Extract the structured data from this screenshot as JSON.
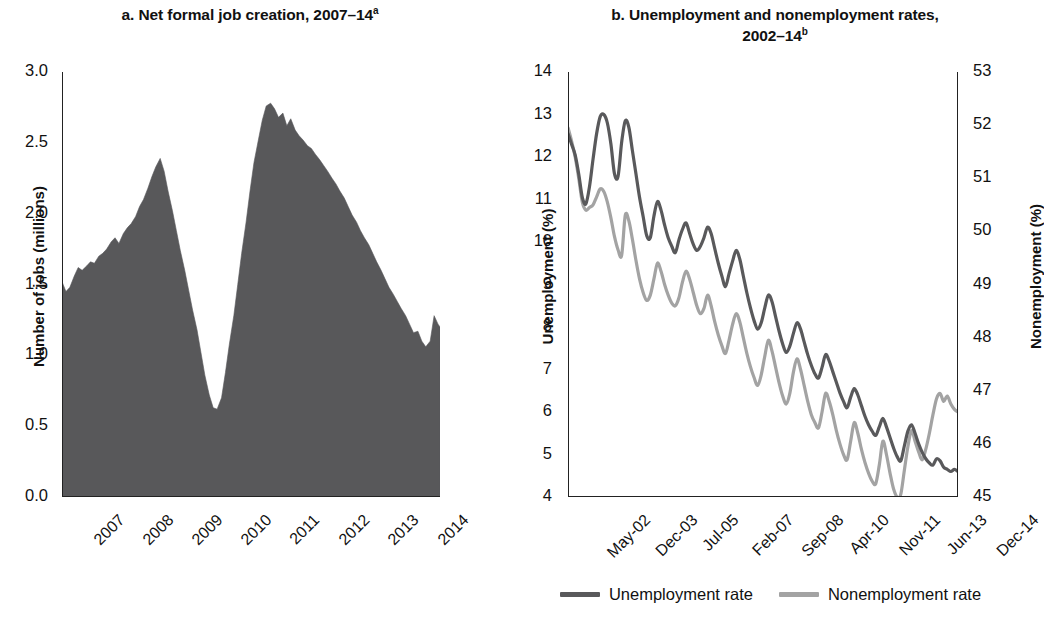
{
  "figure": {
    "panel_a_title_main": "a. Net formal job creation, 2007–14",
    "panel_a_title_sup": "a",
    "panel_b_title_line1": "b. Unemployment and nonemployment rates,",
    "panel_b_title_line2_main": "2002–14",
    "panel_b_title_sup": "b"
  },
  "colors": {
    "area_fill": "#58585a",
    "unemployment_line": "#59595b",
    "nonemployment_line": "#a3a3a3",
    "axis": "#222222",
    "text": "#111111"
  },
  "legend": {
    "items": [
      {
        "label": "Unemployment rate",
        "color": "#59595b"
      },
      {
        "label": "Nonemployment rate",
        "color": "#a3a3a3"
      }
    ]
  },
  "chart_data": [
    {
      "id": "panel-a",
      "type": "area",
      "title": "a. Net formal job creation, 2007–14",
      "xlabel": "",
      "ylabel": "Number of jobs (millions)",
      "ylim": [
        0.0,
        3.0
      ],
      "yticks": [
        "0.0",
        "0.5",
        "1.0",
        "1.5",
        "2.0",
        "2.5",
        "3.0"
      ],
      "ytick_values": [
        0.0,
        0.5,
        1.0,
        1.5,
        2.0,
        2.5,
        3.0
      ],
      "xticks": [
        "2007",
        "2008",
        "2009",
        "2010",
        "2011",
        "2012",
        "2013",
        "2014"
      ],
      "xtick_values": [
        2007,
        2008,
        2009,
        2010,
        2011,
        2012,
        2013,
        2014
      ],
      "xlim": [
        2006.92,
        2014.62
      ],
      "grid": false,
      "x": [
        2006.92,
        2007.0,
        2007.08,
        2007.17,
        2007.25,
        2007.33,
        2007.42,
        2007.5,
        2007.58,
        2007.67,
        2007.75,
        2007.83,
        2007.92,
        2008.0,
        2008.08,
        2008.17,
        2008.25,
        2008.33,
        2008.42,
        2008.5,
        2008.58,
        2008.67,
        2008.75,
        2008.83,
        2008.92,
        2009.0,
        2009.08,
        2009.17,
        2009.25,
        2009.33,
        2009.42,
        2009.5,
        2009.58,
        2009.67,
        2009.75,
        2009.83,
        2009.92,
        2010.0,
        2010.08,
        2010.17,
        2010.25,
        2010.33,
        2010.42,
        2010.5,
        2010.58,
        2010.67,
        2010.75,
        2010.83,
        2010.92,
        2011.0,
        2011.08,
        2011.17,
        2011.25,
        2011.33,
        2011.42,
        2011.5,
        2011.58,
        2011.67,
        2011.75,
        2011.83,
        2011.92,
        2012.0,
        2012.08,
        2012.17,
        2012.25,
        2012.33,
        2012.42,
        2012.5,
        2012.58,
        2012.67,
        2012.75,
        2012.83,
        2012.92,
        2013.0,
        2013.08,
        2013.17,
        2013.25,
        2013.33,
        2013.42,
        2013.5,
        2013.58,
        2013.67,
        2013.75,
        2013.83,
        2013.92,
        2014.0,
        2014.08,
        2014.17,
        2014.25,
        2014.33,
        2014.42,
        2014.5,
        2014.58,
        2014.62
      ],
      "values": [
        1.52,
        1.45,
        1.48,
        1.56,
        1.62,
        1.6,
        1.63,
        1.66,
        1.65,
        1.7,
        1.72,
        1.75,
        1.8,
        1.83,
        1.79,
        1.86,
        1.9,
        1.93,
        1.98,
        2.05,
        2.1,
        2.18,
        2.26,
        2.33,
        2.39,
        2.3,
        2.16,
        2.02,
        1.88,
        1.74,
        1.6,
        1.46,
        1.32,
        1.18,
        1.02,
        0.86,
        0.72,
        0.63,
        0.62,
        0.7,
        0.88,
        1.08,
        1.28,
        1.5,
        1.72,
        1.94,
        2.16,
        2.36,
        2.52,
        2.66,
        2.76,
        2.78,
        2.74,
        2.68,
        2.71,
        2.62,
        2.67,
        2.59,
        2.55,
        2.52,
        2.48,
        2.46,
        2.42,
        2.38,
        2.34,
        2.3,
        2.25,
        2.21,
        2.16,
        2.11,
        2.05,
        1.99,
        1.94,
        1.88,
        1.83,
        1.78,
        1.72,
        1.66,
        1.6,
        1.54,
        1.48,
        1.43,
        1.38,
        1.33,
        1.28,
        1.22,
        1.16,
        1.17,
        1.1,
        1.06,
        1.1,
        1.28,
        1.22,
        1.2
      ],
      "tail_x": [
        2014.25,
        2014.33,
        2014.42,
        2014.5,
        2014.58,
        2014.62
      ],
      "notes": "Area chart, solid dark gray fill from zero baseline. First local peak ~2.39 in late 2008, deep trough ~0.62 in early 2010, maximum ~2.78 in early 2011, long decline to ~0.62 by late 2014."
    },
    {
      "id": "panel-b",
      "type": "line",
      "title": "b. Unemployment and nonemployment rates, 2002–14",
      "xlabel": "",
      "ylabel": "Unemployment  (%)",
      "ylabel_right": "Nonemployment (%)",
      "ylim": [
        4,
        14
      ],
      "yticks": [
        "4",
        "5",
        "6",
        "7",
        "8",
        "9",
        "10",
        "11",
        "12",
        "13",
        "14"
      ],
      "ytick_values": [
        4,
        5,
        6,
        7,
        8,
        9,
        10,
        11,
        12,
        13,
        14
      ],
      "ylim_right": [
        45,
        53
      ],
      "yticks_right": [
        "45",
        "46",
        "47",
        "48",
        "49",
        "50",
        "51",
        "52",
        "53"
      ],
      "ytick_values_right": [
        45,
        46,
        47,
        48,
        49,
        50,
        51,
        52,
        53
      ],
      "xticks": [
        "May-02",
        "Dec-03",
        "Jul-05",
        "Feb-07",
        "Sep-08",
        "Apr-10",
        "Nov-11",
        "Jun-13",
        "Dec-14"
      ],
      "xtick_positions": [
        0,
        0.125,
        0.25,
        0.375,
        0.5,
        0.625,
        0.75,
        0.875,
        1.0
      ],
      "grid": false,
      "legend_position": "bottom-center",
      "series": [
        {
          "name": "Unemployment rate",
          "axis": "left",
          "color": "#59595b",
          "values": [
            12.55,
            12.3,
            12.05,
            11.6,
            11.05,
            10.9,
            11.3,
            11.95,
            12.55,
            12.95,
            13.0,
            12.8,
            12.3,
            11.6,
            11.55,
            12.35,
            12.85,
            12.7,
            12.15,
            11.6,
            11.05,
            10.6,
            10.15,
            10.1,
            10.6,
            10.95,
            10.75,
            10.4,
            10.1,
            9.9,
            9.75,
            10.05,
            10.3,
            10.45,
            10.2,
            9.95,
            9.8,
            9.9,
            10.1,
            10.35,
            10.2,
            9.85,
            9.5,
            9.2,
            8.95,
            9.25,
            9.55,
            9.8,
            9.6,
            9.2,
            8.8,
            8.45,
            8.15,
            7.95,
            8.1,
            8.45,
            8.75,
            8.6,
            8.25,
            7.9,
            7.6,
            7.4,
            7.55,
            7.85,
            8.1,
            7.95,
            7.65,
            7.35,
            7.1,
            6.9,
            6.8,
            7.05,
            7.35,
            7.2,
            6.95,
            6.7,
            6.45,
            6.25,
            6.1,
            6.35,
            6.55,
            6.4,
            6.15,
            5.9,
            5.7,
            5.55,
            5.45,
            5.65,
            5.85,
            5.65,
            5.4,
            5.15,
            4.95,
            4.85,
            5.2,
            5.55,
            5.7,
            5.5,
            5.25,
            5.05,
            4.9,
            4.8,
            4.75,
            4.9,
            4.85,
            4.7,
            4.65,
            4.6,
            4.65,
            4.6
          ],
          "start_label": "May-02",
          "end_label": "Dec-14",
          "start_value": 12.55,
          "end_value": 4.6,
          "max_value": 13.0,
          "min_value": 4.6
        },
        {
          "name": "Nonemployment rate",
          "axis": "right",
          "color": "#a3a3a3",
          "values": [
            51.95,
            51.7,
            51.4,
            51.0,
            50.55,
            50.4,
            50.45,
            50.5,
            50.65,
            50.8,
            50.75,
            50.55,
            50.25,
            49.9,
            49.65,
            49.55,
            50.3,
            50.2,
            49.85,
            49.45,
            49.1,
            48.85,
            48.7,
            48.8,
            49.1,
            49.4,
            49.25,
            49.0,
            48.8,
            48.65,
            48.6,
            48.75,
            49.05,
            49.25,
            49.1,
            48.85,
            48.6,
            48.45,
            48.55,
            48.8,
            48.6,
            48.3,
            48.05,
            47.85,
            47.7,
            47.95,
            48.25,
            48.45,
            48.3,
            48.0,
            47.7,
            47.45,
            47.25,
            47.1,
            47.3,
            47.65,
            47.95,
            47.75,
            47.45,
            47.15,
            46.9,
            46.75,
            46.95,
            47.35,
            47.6,
            47.4,
            47.1,
            46.8,
            46.55,
            46.4,
            46.3,
            46.6,
            46.95,
            46.8,
            46.55,
            46.25,
            46.0,
            45.8,
            45.7,
            46.05,
            46.4,
            46.2,
            45.9,
            45.65,
            45.45,
            45.3,
            45.25,
            45.6,
            46.05,
            45.8,
            45.45,
            45.15,
            45.0,
            45.05,
            45.5,
            45.95,
            46.25,
            46.05,
            45.85,
            45.7,
            45.9,
            46.2,
            46.55,
            46.85,
            46.95,
            46.8,
            46.9,
            46.75,
            46.65,
            46.6
          ],
          "start_label": "May-02",
          "end_label": "Dec-14",
          "start_value": 51.95,
          "end_value": 46.6,
          "max_value": 52.0,
          "min_value": 45.0
        }
      ],
      "notes": "Two monthly series with strong seasonal oscillation and downward trend. Left axis for unemployment (dark line), right axis for nonemployment (light gray line)."
    }
  ]
}
